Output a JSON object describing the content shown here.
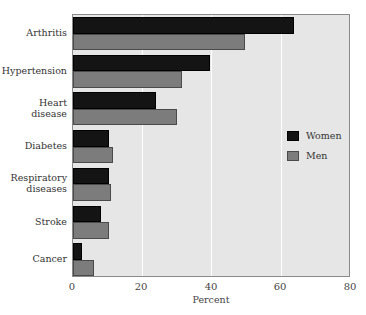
{
  "chart_data": {
    "type": "bar",
    "orientation": "horizontal",
    "title": "",
    "xlabel": "Percent",
    "ylabel": "",
    "xlim": [
      0,
      80
    ],
    "xticks": [
      0,
      20,
      40,
      60,
      80
    ],
    "grid": true,
    "legend_position": "right-center inside plot",
    "categories": [
      "Arthritis",
      "Hypertension",
      "Heart disease",
      "Diabetes",
      "Respiratory diseases",
      "Stroke",
      "Cancer"
    ],
    "series": [
      {
        "name": "Women",
        "color": "#141414",
        "values": [
          63.5,
          39.5,
          24,
          10.5,
          10.5,
          8,
          2.5
        ]
      },
      {
        "name": "Men",
        "color": "#7c7c7c",
        "values": [
          49.5,
          31.5,
          30,
          11.5,
          11,
          10.5,
          6
        ]
      }
    ]
  },
  "labels": {
    "categories": [
      [
        "Arthritis"
      ],
      [
        "Hypertension"
      ],
      [
        "Heart",
        "disease"
      ],
      [
        "Diabetes"
      ],
      [
        "Respiratory",
        "diseases"
      ],
      [
        "Stroke"
      ],
      [
        "Cancer"
      ]
    ],
    "xticks": [
      "0",
      "20",
      "40",
      "60",
      "80"
    ],
    "xlabel": "Percent",
    "legend": [
      "Women",
      "Men"
    ]
  }
}
